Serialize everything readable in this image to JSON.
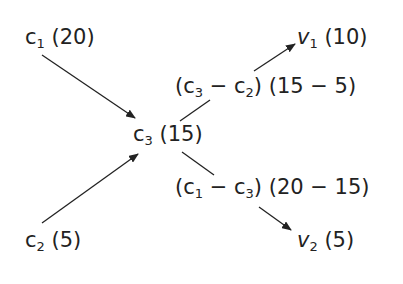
{
  "diagram": {
    "nodes": {
      "c1": {
        "var": "c",
        "sub": "1",
        "value": "(20)"
      },
      "c2": {
        "var": "c",
        "sub": "2",
        "value": "(5)"
      },
      "c3": {
        "var": "c",
        "sub": "3",
        "value": "(15)"
      },
      "v1": {
        "var": "v",
        "sub": "1",
        "value": "(10)"
      },
      "v2": {
        "var": "v",
        "sub": "2",
        "value": "(5)"
      }
    },
    "edge_labels": {
      "upper": {
        "a_var": "c",
        "a_sub": "3",
        "op": "−",
        "b_var": "c",
        "b_sub": "2",
        "expr": "(15 − 5)"
      },
      "lower": {
        "a_var": "c",
        "a_sub": "1",
        "op": "−",
        "b_var": "c",
        "b_sub": "3",
        "expr": "(20 − 15)"
      }
    },
    "edges": [
      {
        "from": "c1",
        "to": "c3"
      },
      {
        "from": "c2",
        "to": "c3"
      },
      {
        "from": "c3",
        "to": "v1",
        "label": "upper"
      },
      {
        "from": "c3",
        "to": "v2",
        "label": "lower"
      }
    ]
  }
}
